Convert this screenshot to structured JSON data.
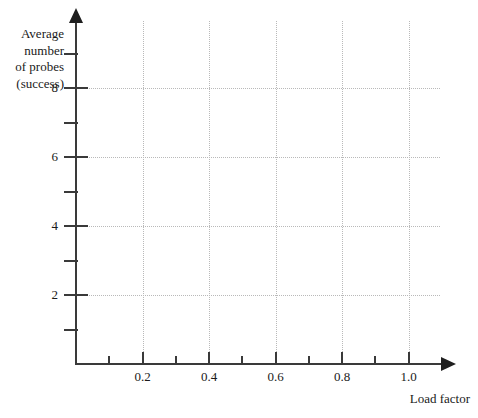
{
  "chart_data": {
    "type": "line",
    "title": "",
    "subtitle": "",
    "xlabel": "Load factor",
    "ylabel_lines": [
      "Average",
      "number",
      "of probes",
      "(success)"
    ],
    "ylabel": "Average number of probes (success)",
    "xlim": [
      0.0,
      1.1
    ],
    "ylim": [
      0.0,
      9.6
    ],
    "x_major_ticks": [
      0.2,
      0.4,
      0.6,
      0.8,
      1.0
    ],
    "x_major_tick_labels": [
      "0.2",
      "0.4",
      "0.6",
      "0.8",
      "1.0"
    ],
    "x_minor_ticks": [
      0.1,
      0.3,
      0.5,
      0.7,
      0.9
    ],
    "y_major_ticks": [
      2,
      4,
      6,
      8
    ],
    "y_major_tick_labels": [
      "2",
      "4",
      "6",
      "8"
    ],
    "y_minor_ticks": [
      1,
      3,
      5,
      7,
      9
    ],
    "grid": true,
    "grid_style": "dotted",
    "grid_on_major_only": true,
    "legend": false,
    "legend_position": "none",
    "series": [],
    "annotations": [],
    "note": "Empty plotting template: axes, ticks and gridlines only, no data curves drawn."
  },
  "style": {
    "background_color": "#ffffff",
    "axis_color": "#3a3a3a",
    "arrow_color": "#1f1f1f",
    "grid_color": "#b9b9b9",
    "text_color": "#1a1a1a"
  }
}
